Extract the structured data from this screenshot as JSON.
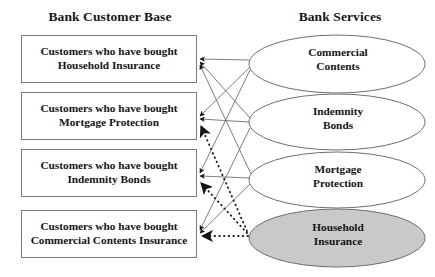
{
  "headings": {
    "left": "Bank Customer Base",
    "right": "Bank Services"
  },
  "customer_boxes": [
    {
      "id": "household-insurance",
      "label": "Customers who have bought\nHousehold Insurance"
    },
    {
      "id": "mortgage-protection",
      "label": "Customers who have bought\nMortgage Protection"
    },
    {
      "id": "indemnity-bonds",
      "label": "Customers who have bought\nIndemnity Bonds"
    },
    {
      "id": "commercial-contents-insurance",
      "label": "Customers who have bought\nCommercial Contents Insurance"
    }
  ],
  "services": [
    {
      "id": "commercial-contents",
      "label": "Commercial\nContents",
      "fill": "#ffffff",
      "highlighted": false
    },
    {
      "id": "indemnity-bonds",
      "label": "Indemnity\nBonds",
      "fill": "#ffffff",
      "highlighted": false
    },
    {
      "id": "mortgage-protection",
      "label": "Mortgage\nProtection",
      "fill": "#ffffff",
      "highlighted": false
    },
    {
      "id": "household-insurance",
      "label": "Household\nInsurance",
      "fill": "#c9c9c9",
      "highlighted": true
    }
  ],
  "colors": {
    "line": "#6e6e6e",
    "dotted_line": "#1d1d1d",
    "box_border": "#7a7a7a",
    "ellipse_border": "#6e6e6e",
    "highlight_fill": "#c9c9c9",
    "text": "#141414",
    "background": "#ffffff"
  },
  "edges": [
    {
      "id": "commercial-contents-to-household",
      "from_service": "commercial-contents",
      "to_box": "household-insurance",
      "style": "solid"
    },
    {
      "id": "commercial-contents-to-mortgage",
      "from_service": "commercial-contents",
      "to_box": "mortgage-protection",
      "style": "solid"
    },
    {
      "id": "commercial-contents-to-indemnity",
      "from_service": "commercial-contents",
      "to_box": "indemnity-bonds",
      "style": "solid"
    },
    {
      "id": "indemnity-to-household",
      "from_service": "indemnity-bonds",
      "to_box": "household-insurance",
      "style": "solid"
    },
    {
      "id": "indemnity-to-mortgage",
      "from_service": "indemnity-bonds",
      "to_box": "mortgage-protection",
      "style": "solid"
    },
    {
      "id": "indemnity-to-commercial-box",
      "from_service": "indemnity-bonds",
      "to_box": "commercial-contents-insurance",
      "style": "solid"
    },
    {
      "id": "mortgage-to-household",
      "from_service": "mortgage-protection",
      "to_box": "household-insurance",
      "style": "solid"
    },
    {
      "id": "mortgage-to-indemnity",
      "from_service": "mortgage-protection",
      "to_box": "indemnity-bonds",
      "style": "solid"
    },
    {
      "id": "mortgage-to-commercial-box",
      "from_service": "mortgage-protection",
      "to_box": "commercial-contents-insurance",
      "style": "solid"
    },
    {
      "id": "household-to-mortgage",
      "from_service": "household-insurance",
      "to_box": "mortgage-protection",
      "style": "dotted"
    },
    {
      "id": "household-to-indemnity",
      "from_service": "household-insurance",
      "to_box": "indemnity-bonds",
      "style": "dotted"
    },
    {
      "id": "household-to-commercial-box",
      "from_service": "household-insurance",
      "to_box": "commercial-contents-insurance",
      "style": "dotted"
    }
  ]
}
